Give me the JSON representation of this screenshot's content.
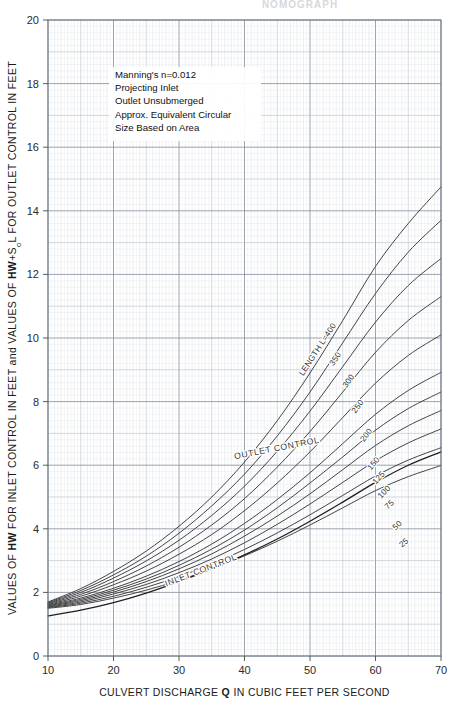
{
  "title": "NOMOGRAPH",
  "axes": {
    "x": {
      "label_parts": [
        "CULVERT DISCHARGE ",
        "Q",
        " IN CUBIC FEET PER SECOND"
      ],
      "label": "CULVERT DISCHARGE Q IN CUBIC FEET PER SECOND",
      "min": 10,
      "max": 70,
      "ticks": [
        10,
        20,
        30,
        40,
        50,
        60,
        70
      ],
      "tick_labels": [
        "10",
        "20",
        "30",
        "40",
        "50",
        "60",
        "70"
      ],
      "major_step": 10,
      "minor_step": 1
    },
    "y": {
      "label_parts": [
        "VALUES OF ",
        "HW",
        " FOR INLET CONTROL IN FEET and VALUES OF ",
        "HW",
        "+S",
        "o",
        "L FOR OUTLET CONTROL IN FEET"
      ],
      "label": "VALUES OF HW FOR INLET CONTROL IN FEET and VALUES OF HW+SoL FOR OUTLET CONTROL IN FEET",
      "min": 0,
      "max": 20,
      "ticks": [
        0,
        2,
        4,
        6,
        8,
        10,
        12,
        14,
        16,
        18,
        20
      ],
      "tick_labels": [
        "0",
        "2",
        "4",
        "6",
        "8",
        "10",
        "12",
        "14",
        "16",
        "18",
        "20"
      ],
      "major_step": 2,
      "minor_step": 0.2
    }
  },
  "note": {
    "lines": [
      "Manning's n=0.012",
      "Projecting Inlet",
      "Outlet Unsubmerged",
      "Approx. Equivalent Circular",
      "Size Based on Area"
    ]
  },
  "annotations": [
    {
      "name": "inlet-control-label",
      "text": "INLET CONTROL",
      "x": 33.5,
      "y": 2.62,
      "rotate": -21
    },
    {
      "name": "outlet-control-label",
      "text": "OUTLET CONTROL",
      "x": 45.0,
      "y": 6.45,
      "rotate": -11
    }
  ],
  "colors": {
    "curve": "#3a3a3a",
    "inlet_curve": "#1f1f1f",
    "grid_minor": "#c9cfd8",
    "grid_mid": "#aab3bf",
    "grid_major": "#7d8694",
    "frame": "#6b7480",
    "text": "#1a1a1a",
    "background": "#ffffff"
  },
  "chart_data": {
    "type": "line",
    "xlabel": "CULVERT DISCHARGE Q IN CUBIC FEET PER SECOND",
    "ylabel": "VALUES OF HW FOR INLET CONTROL IN FEET and VALUES OF HW+SoL FOR OUTLET CONTROL IN FEET",
    "xlim": [
      10,
      70
    ],
    "ylim": [
      0,
      20
    ],
    "grid": true,
    "legend": "inline curve labels at right",
    "x": [
      10,
      15,
      20,
      25,
      30,
      35,
      40,
      45,
      50,
      55,
      60,
      65,
      70
    ],
    "series": [
      {
        "name": "LENGTH L=400",
        "label": "LENGTH L=400",
        "values": [
          1.7,
          2.12,
          2.66,
          3.3,
          4.08,
          5.0,
          6.1,
          7.4,
          8.9,
          10.55,
          12.25,
          13.6,
          14.75
        ]
      },
      {
        "name": "350",
        "label": "350",
        "values": [
          1.68,
          2.06,
          2.55,
          3.14,
          3.86,
          4.72,
          5.72,
          6.92,
          8.3,
          9.85,
          11.4,
          12.7,
          13.7
        ]
      },
      {
        "name": "300",
        "label": "300",
        "values": [
          1.66,
          2.0,
          2.45,
          2.99,
          3.64,
          4.42,
          5.34,
          6.44,
          7.7,
          9.1,
          10.5,
          11.65,
          12.5
        ]
      },
      {
        "name": "250",
        "label": "250",
        "values": [
          1.64,
          1.94,
          2.34,
          2.83,
          3.42,
          4.12,
          4.95,
          5.94,
          7.06,
          8.3,
          9.55,
          10.55,
          11.3
        ]
      },
      {
        "name": "200",
        "label": "200",
        "values": [
          1.62,
          1.88,
          2.24,
          2.67,
          3.2,
          3.82,
          4.57,
          5.44,
          6.42,
          7.5,
          8.58,
          9.45,
          10.1
        ]
      },
      {
        "name": "150",
        "label": "150",
        "values": [
          1.6,
          1.82,
          2.13,
          2.51,
          2.97,
          3.52,
          4.17,
          4.92,
          5.76,
          6.68,
          7.6,
          8.35,
          8.92
        ]
      },
      {
        "name": "125",
        "label": "125",
        "values": [
          1.58,
          1.78,
          2.07,
          2.42,
          2.85,
          3.36,
          3.96,
          4.66,
          5.44,
          6.26,
          7.1,
          7.78,
          8.3
        ]
      },
      {
        "name": "100",
        "label": "100",
        "values": [
          1.56,
          1.74,
          2.01,
          2.34,
          2.74,
          3.21,
          3.77,
          4.4,
          5.1,
          5.86,
          6.62,
          7.24,
          7.72
        ]
      },
      {
        "name": "75",
        "label": "75",
        "values": [
          1.54,
          1.7,
          1.95,
          2.25,
          2.62,
          3.05,
          3.56,
          4.14,
          4.78,
          5.46,
          6.14,
          6.7,
          7.14
        ]
      },
      {
        "name": "50",
        "label": "50",
        "values": [
          1.52,
          1.66,
          1.88,
          2.16,
          2.5,
          2.89,
          3.35,
          3.87,
          4.44,
          5.05,
          5.66,
          6.16,
          6.55
        ]
      },
      {
        "name": "25",
        "label": "25",
        "values": [
          1.5,
          1.62,
          1.82,
          2.07,
          2.38,
          2.74,
          3.15,
          3.61,
          4.12,
          4.66,
          5.2,
          5.64,
          5.99
        ]
      },
      {
        "name": "INLET CONTROL",
        "label": "",
        "values": [
          1.26,
          1.44,
          1.68,
          1.98,
          2.34,
          2.74,
          3.18,
          3.68,
          4.24,
          4.84,
          5.46,
          6.0,
          6.42
        ]
      }
    ],
    "curve_labels": [
      {
        "text": "LENGTH L=400",
        "x": 51.5,
        "y": 9.6,
        "rotate": -57
      },
      {
        "text": "350",
        "x": 54.2,
        "y": 9.3,
        "rotate": -57
      },
      {
        "text": "300",
        "x": 56.2,
        "y": 8.6,
        "rotate": -55
      },
      {
        "text": "250",
        "x": 57.6,
        "y": 7.8,
        "rotate": -54
      },
      {
        "text": "200",
        "x": 58.9,
        "y": 6.9,
        "rotate": -52
      },
      {
        "text": "150",
        "x": 60.0,
        "y": 6.0,
        "rotate": -50
      },
      {
        "text": "125",
        "x": 60.8,
        "y": 5.55,
        "rotate": -48
      },
      {
        "text": "100",
        "x": 61.6,
        "y": 5.1,
        "rotate": -46
      },
      {
        "text": "75",
        "x": 62.4,
        "y": 4.7,
        "rotate": -44
      },
      {
        "text": "50",
        "x": 63.6,
        "y": 4.05,
        "rotate": -42
      },
      {
        "text": "25",
        "x": 64.6,
        "y": 3.5,
        "rotate": -40
      }
    ]
  }
}
